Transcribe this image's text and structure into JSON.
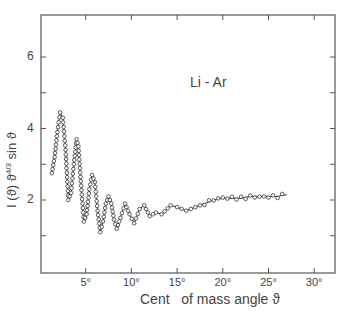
{
  "chart_data": {
    "type": "scatter",
    "title": "",
    "annotation": "Li - Ar",
    "xlabel": "Cent   of mass angle ϑ",
    "ylabel": "I (ϑ) ϑ^4/3 sin ϑ",
    "ylabel_parts": {
      "main": "I (ϑ) ϑ",
      "sup": "4/3",
      "tail": " sin ϑ"
    },
    "xlim": [
      0,
      32
    ],
    "ylim": [
      0,
      7.2
    ],
    "grid": false,
    "legend": null,
    "x_ticks": [
      {
        "value": 5,
        "label": "5°"
      },
      {
        "value": 10,
        "label": "10°"
      },
      {
        "value": 15,
        "label": "15°"
      },
      {
        "value": 20,
        "label": "20°"
      },
      {
        "value": 25,
        "label": "25°"
      },
      {
        "value": 30,
        "label": "30°"
      }
    ],
    "y_ticks": [
      {
        "value": 1,
        "label": ""
      },
      {
        "value": 2,
        "label": "2"
      },
      {
        "value": 3,
        "label": ""
      },
      {
        "value": 4,
        "label": "4"
      },
      {
        "value": 5,
        "label": ""
      },
      {
        "value": 6,
        "label": "6"
      }
    ],
    "series": [
      {
        "name": "measured (open circles) with fitted curve",
        "marker": "open-circle",
        "line": true,
        "x": [
          1.3,
          1.6,
          1.9,
          2.2,
          2.5,
          2.8,
          3.1,
          3.4,
          3.7,
          4.0,
          4.2,
          4.5,
          4.8,
          5.1,
          5.4,
          5.7,
          6.0,
          6.3,
          6.6,
          6.9,
          7.2,
          7.5,
          7.8,
          8.1,
          8.4,
          8.8,
          9.3,
          9.8,
          10.3,
          10.9,
          11.4,
          12.0,
          12.7,
          13.3,
          14.3,
          15.0,
          16.0,
          17.0,
          18.0,
          19.0,
          20.0,
          21.0,
          22.0,
          23.0,
          24.0,
          25.0,
          26.0,
          27.0
        ],
        "y": [
          2.75,
          3.2,
          3.9,
          4.45,
          4.3,
          3.4,
          2.0,
          2.2,
          3.0,
          3.7,
          3.5,
          2.4,
          1.4,
          1.6,
          2.3,
          2.7,
          2.5,
          1.7,
          1.1,
          1.4,
          1.9,
          2.1,
          1.9,
          1.45,
          1.2,
          1.5,
          1.9,
          1.6,
          1.35,
          1.75,
          1.85,
          1.55,
          1.65,
          1.6,
          1.85,
          1.8,
          1.7,
          1.8,
          1.9,
          2.0,
          2.05,
          2.05,
          2.05,
          2.1,
          2.1,
          2.1,
          2.1,
          2.15
        ]
      }
    ]
  }
}
